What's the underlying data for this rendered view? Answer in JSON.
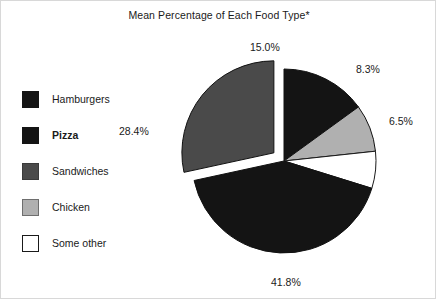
{
  "chart": {
    "title": "Mean Percentage of Each Food Type*"
  },
  "legend": {
    "items": [
      {
        "label": "Hamburgers",
        "color": "#141414",
        "border": "#141414",
        "bold": false
      },
      {
        "label": "Pizza",
        "color": "#141414",
        "border": "#141414",
        "bold": true
      },
      {
        "label": "Sandwiches",
        "color": "#4a4a4a",
        "border": "#3a3a3a",
        "bold": false
      },
      {
        "label": "Chicken",
        "color": "#b0b0b0",
        "border": "#6e6e6e",
        "bold": false
      },
      {
        "label": "Some other",
        "color": "#ffffff",
        "border": "#1a1a1a",
        "bold": false
      }
    ]
  },
  "labels": {
    "hamburgers": "15.0%",
    "chicken": "8.3%",
    "some_other": "6.5%",
    "pizza": "41.8%",
    "sandwiches": "28.4%"
  },
  "chart_data": {
    "type": "pie",
    "title": "Mean Percentage of Each Food Type*",
    "xlabel": "",
    "ylabel": "",
    "legend_position": "left",
    "grid": false,
    "start_angle_deg": 0,
    "direction": "clockwise",
    "exploded_slices": [
      "Sandwiches"
    ],
    "categories": [
      "Hamburgers",
      "Chicken",
      "Some other",
      "Pizza",
      "Sandwiches"
    ],
    "values": [
      15.0,
      8.3,
      6.5,
      41.8,
      28.4
    ],
    "labels": [
      "15.0%",
      "8.3%",
      "6.5%",
      "41.8%",
      "28.4%"
    ],
    "colors": [
      "#141414",
      "#b0b0b0",
      "#ffffff",
      "#141414",
      "#4a4a4a"
    ],
    "series": [
      {
        "name": "Mean Percentage",
        "values": [
          15.0,
          8.3,
          6.5,
          41.8,
          28.4
        ]
      }
    ]
  }
}
